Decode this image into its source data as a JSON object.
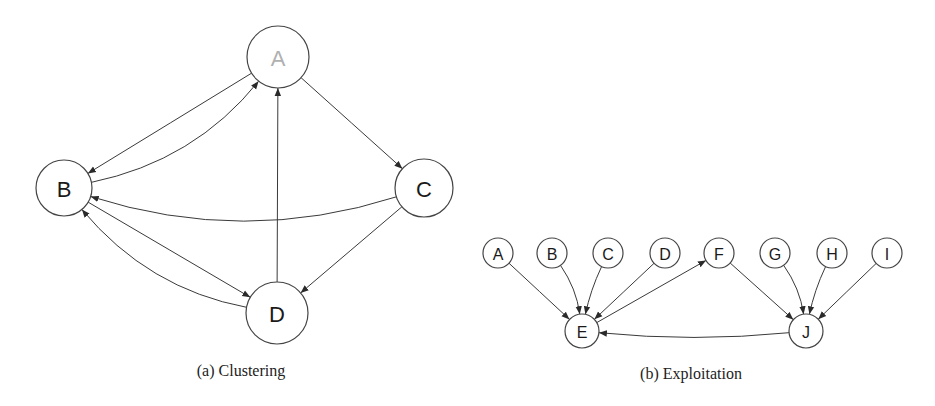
{
  "figure_a": {
    "caption": "(a) Clustering",
    "nodes": [
      {
        "id": "A",
        "label": "A",
        "cx": 278,
        "cy": 57,
        "r": 31,
        "faded": true
      },
      {
        "id": "B",
        "label": "B",
        "cx": 64,
        "cy": 188,
        "r": 28,
        "faded": false
      },
      {
        "id": "C",
        "label": "C",
        "cx": 424,
        "cy": 188,
        "r": 29,
        "faded": false
      },
      {
        "id": "D",
        "label": "D",
        "cx": 277,
        "cy": 313,
        "r": 31,
        "faded": false
      }
    ],
    "edges": [
      {
        "from": "B",
        "to": "A",
        "bend": 0.18
      },
      {
        "from": "A",
        "to": "B",
        "bend": 0
      },
      {
        "from": "A",
        "to": "C",
        "bend": 0
      },
      {
        "from": "D",
        "to": "A",
        "bend": 0
      },
      {
        "from": "C",
        "to": "B",
        "bend": -0.16
      },
      {
        "from": "B",
        "to": "D",
        "bend": 0
      },
      {
        "from": "D",
        "to": "B",
        "bend": -0.18
      },
      {
        "from": "C",
        "to": "D",
        "bend": 0
      }
    ]
  },
  "figure_b": {
    "caption": "(b) Exploitation",
    "nodes": [
      {
        "id": "A",
        "label": "A",
        "cx": 498,
        "cy": 253,
        "r": 15
      },
      {
        "id": "B",
        "label": "B",
        "cx": 552,
        "cy": 253,
        "r": 15
      },
      {
        "id": "C",
        "label": "C",
        "cx": 608,
        "cy": 253,
        "r": 15
      },
      {
        "id": "D",
        "label": "D",
        "cx": 665,
        "cy": 253,
        "r": 15
      },
      {
        "id": "F",
        "label": "F",
        "cx": 719,
        "cy": 253,
        "r": 15
      },
      {
        "id": "G",
        "label": "G",
        "cx": 775,
        "cy": 253,
        "r": 15
      },
      {
        "id": "H",
        "label": "H",
        "cx": 832,
        "cy": 253,
        "r": 15
      },
      {
        "id": "I",
        "label": "I",
        "cx": 887,
        "cy": 253,
        "r": 15
      },
      {
        "id": "E",
        "label": "E",
        "cx": 582,
        "cy": 331,
        "r": 17
      },
      {
        "id": "J",
        "label": "J",
        "cx": 806,
        "cy": 331,
        "r": 17
      }
    ],
    "edges": [
      {
        "from": "A",
        "to": "E",
        "bend": 0
      },
      {
        "from": "B",
        "to": "E",
        "bend": -0.12
      },
      {
        "from": "C",
        "to": "E",
        "bend": 0.06
      },
      {
        "from": "D",
        "to": "E",
        "bend": 0
      },
      {
        "from": "E",
        "to": "F",
        "bend": 0
      },
      {
        "from": "F",
        "to": "J",
        "bend": 0
      },
      {
        "from": "G",
        "to": "J",
        "bend": -0.12
      },
      {
        "from": "H",
        "to": "J",
        "bend": 0.06
      },
      {
        "from": "I",
        "to": "J",
        "bend": 0
      },
      {
        "from": "J",
        "to": "E",
        "bend": -0.05
      }
    ]
  },
  "colors": {
    "stroke": "#3a3a3a",
    "node_border": "#444444",
    "label": "#1a1a1a",
    "faded_label": "#b0b0b0",
    "background": "#ffffff"
  }
}
